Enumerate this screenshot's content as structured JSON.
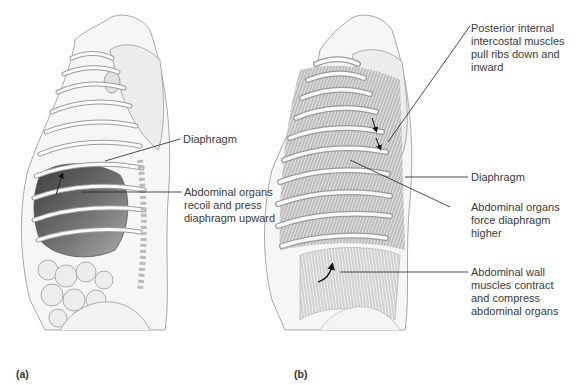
{
  "panels": [
    {
      "id": "a",
      "panel_label": "(a)",
      "labels": [
        {
          "text": "Diaphragm"
        },
        {
          "text": "Abdominal organs\nrecoil and press\ndiaphragm upward"
        }
      ]
    },
    {
      "id": "b",
      "panel_label": "(b)",
      "labels": [
        {
          "text": "Posterior internal\nintercostal muscles\npull ribs down and\ninward"
        },
        {
          "text": "Diaphragm"
        },
        {
          "text": "Abdominal organs\nforce diaphragm\nhigher"
        },
        {
          "text": "Abdominal wall\nmuscles contract\nand compress\nabdominal organs"
        }
      ]
    }
  ],
  "colors": {
    "outline": "#8a8a8a",
    "rib_fill": "#e8e8e8",
    "organ_dark": "#555555",
    "muscle": "#9a9a9a",
    "leader_line": "#222222",
    "text": "#3a3a3a"
  }
}
